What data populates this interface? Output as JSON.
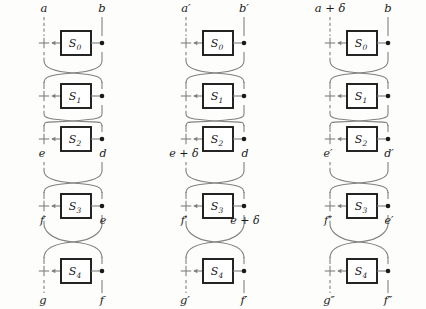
{
  "figure": {
    "background_color": "#fdfdfb",
    "line_color": "#808080",
    "box_stroke_color": "#1a1a1a",
    "text_color": "#1a1a1a",
    "rounds": 5,
    "sbox_labels": [
      "S0",
      "S1",
      "S2",
      "S3",
      "S4"
    ],
    "sbox_sub": [
      "0",
      "1",
      "2",
      "3",
      "4"
    ],
    "xor_symbol": "+",
    "arrow_symbol": "←",
    "diagrams": [
      {
        "name": "left-diagram",
        "x_left_rail": 44,
        "x_right_rail": 102,
        "labels": {
          "top_left": "a",
          "top_right": "b",
          "mid_left": "e",
          "mid_right": "d",
          "mid2_left": "f",
          "mid2_right": "e",
          "bottom_left": "g",
          "bottom_right": "f"
        }
      },
      {
        "name": "middle-diagram",
        "x_left_rail": 186,
        "x_right_rail": 244,
        "labels": {
          "top_left": "a′",
          "top_right": "b′",
          "mid_left": "e + δ",
          "mid_right": "d",
          "mid2_left": "f′",
          "mid2_right": "e + δ",
          "bottom_left": "g′",
          "bottom_right": "f′"
        }
      },
      {
        "name": "right-diagram",
        "x_left_rail": 330,
        "x_right_rail": 388,
        "labels": {
          "top_left": "a + δ",
          "top_right": "b",
          "mid_left": "e′",
          "mid_right": "d′",
          "mid2_left": "f″",
          "mid2_right": "e′",
          "bottom_left": "g″",
          "bottom_right": "f″"
        }
      }
    ],
    "round_rows": [
      {
        "index": 0,
        "y_center": 43,
        "sbox": "S0"
      },
      {
        "index": 1,
        "y_center": 96,
        "sbox": "S1"
      },
      {
        "index": 2,
        "y_center": 139,
        "sbox": "S2"
      },
      {
        "index": 3,
        "y_center": 206,
        "sbox": "S3"
      },
      {
        "index": 4,
        "y_center": 271,
        "sbox": "S4"
      }
    ]
  }
}
